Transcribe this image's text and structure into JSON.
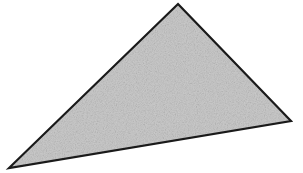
{
  "figure": {
    "name": "shaded-scalene-triangle",
    "type": "geometric-shape",
    "shape": "triangle",
    "classification": "scalene obtuse triangle",
    "canvas": {
      "width": 303,
      "height": 173,
      "background_color": "#ffffff"
    },
    "style": {
      "fill_color": "#c8c8c8",
      "fill_texture": "fine gray speckled noise / grain",
      "stroke_color": "#1a1a1a",
      "stroke_width": 2,
      "stroke_linejoin": "miter"
    },
    "vertices": [
      {
        "label": "apex",
        "x": 178,
        "y": 4
      },
      {
        "label": "right",
        "x": 291,
        "y": 121
      },
      {
        "label": "bottom-left",
        "x": 9,
        "y": 168
      }
    ],
    "polygon_points": "178,4 291,121 9,168",
    "edges": [
      {
        "label": "left-edge",
        "from": "apex",
        "to": "bottom-left"
      },
      {
        "label": "right-edge",
        "from": "apex",
        "to": "right"
      },
      {
        "label": "base-edge",
        "from": "bottom-left",
        "to": "right"
      }
    ],
    "labels": [],
    "annotations": []
  }
}
